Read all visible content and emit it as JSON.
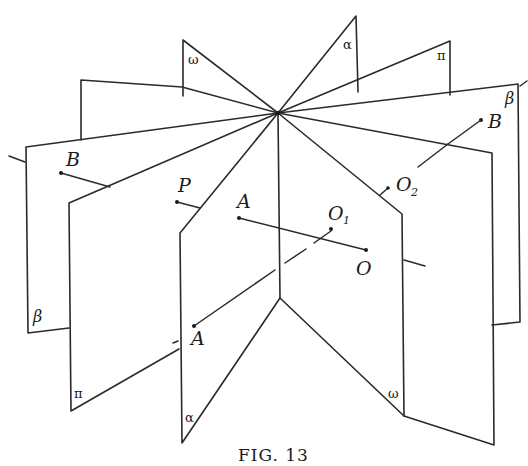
{
  "figure": {
    "caption": "Fig. 13",
    "caption_display": "FIG. 13"
  },
  "planes": {
    "alpha": {
      "label": "α"
    },
    "omega": {
      "label": "ω"
    },
    "pi": {
      "label": "π"
    },
    "beta": {
      "label": "β"
    }
  },
  "points": {
    "B_left": {
      "label": "B"
    },
    "B_right": {
      "label": "B"
    },
    "P": {
      "label": "P"
    },
    "A_upper": {
      "label": "A"
    },
    "A_lower": {
      "label": "A"
    },
    "O": {
      "label": "O"
    },
    "O1": {
      "label": "O",
      "subscript": "1"
    },
    "O2": {
      "label": "O",
      "subscript": "2"
    }
  }
}
